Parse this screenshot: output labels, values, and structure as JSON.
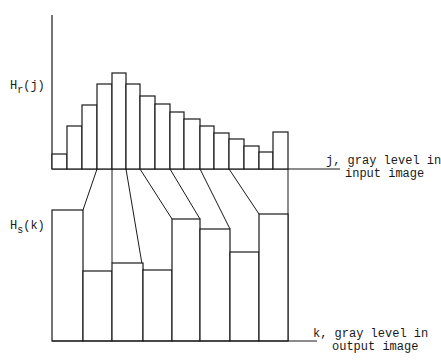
{
  "diagram": {
    "top_axis": {
      "ylabel_main": "H",
      "ylabel_sub": "r",
      "ylabel_arg": "(j)",
      "xlabel_line1": "j, gray level in",
      "xlabel_line2": "input image"
    },
    "bottom_axis": {
      "ylabel_main": "H",
      "ylabel_sub": "s",
      "ylabel_arg": "(k)",
      "xlabel_line1": "k, gray level in",
      "xlabel_line2": "output image"
    },
    "colors": {
      "line": "#1a1a1a",
      "background": "#ffffff"
    }
  },
  "chart_data": [
    {
      "type": "bar",
      "title": "Input histogram H_r(j)",
      "xlabel": "j, gray level in input image",
      "ylabel": "H_r(j)",
      "bin_edges_px": [
        52,
        67,
        82,
        97,
        112,
        126,
        140,
        155,
        170,
        184,
        200,
        214,
        229,
        244,
        259,
        273,
        288
      ],
      "values": [
        15,
        43,
        64,
        85,
        96,
        85,
        73,
        65,
        57,
        50,
        43,
        36,
        30,
        23,
        17,
        37
      ],
      "baseline_px": 169,
      "grid": false
    },
    {
      "type": "bar",
      "title": "Output histogram H_s(k)",
      "xlabel": "k, gray level in output image",
      "ylabel": "H_s(k)",
      "bin_edges_px": [
        52,
        83,
        112,
        143,
        172,
        200,
        230,
        259,
        288
      ],
      "values": [
        131,
        70,
        78,
        71,
        122,
        112,
        89,
        127
      ],
      "baseline_px": 341,
      "grid": false
    }
  ],
  "mapping_lines": [
    {
      "from": [
        97,
        169
      ],
      "to": [
        83,
        210
      ]
    },
    {
      "from": [
        112,
        169
      ],
      "to": [
        112,
        263
      ]
    },
    {
      "from": [
        126,
        169
      ],
      "to": [
        143,
        270
      ]
    },
    {
      "from": [
        140,
        169
      ],
      "to": [
        172,
        219
      ]
    },
    {
      "from": [
        170,
        169
      ],
      "to": [
        200,
        219
      ]
    },
    {
      "from": [
        200,
        169
      ],
      "to": [
        230,
        229
      ]
    },
    {
      "from": [
        229,
        169
      ],
      "to": [
        259,
        214
      ]
    },
    {
      "from": [
        288,
        169
      ],
      "to": [
        288,
        341
      ]
    }
  ]
}
